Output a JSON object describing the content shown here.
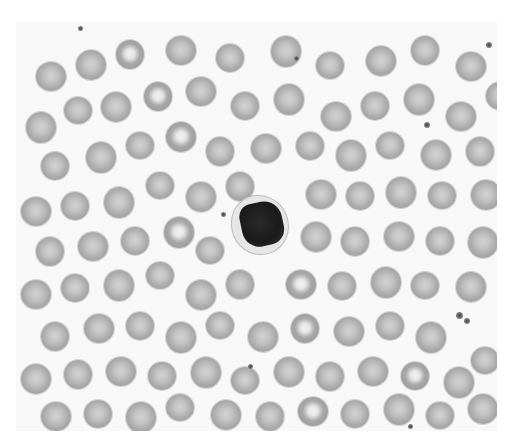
{
  "image": {
    "subject": "peripheral blood smear",
    "background_color": "#f8f8f8",
    "rbc_color": "#a9a9a9",
    "nucleus_color": "#1a1a1a"
  },
  "features": {
    "lymphocyte": {
      "x": 244,
      "y": 225,
      "label": "lymphocyte"
    },
    "platelet_cluster": {
      "x": 450,
      "y": 300
    }
  },
  "cells": [
    [
      20,
      40,
      30
    ],
    [
      60,
      28,
      30
    ],
    [
      100,
      18,
      28
    ],
    [
      150,
      14,
      30
    ],
    [
      200,
      22,
      28
    ],
    [
      255,
      14,
      30
    ],
    [
      300,
      30,
      28
    ],
    [
      350,
      24,
      30
    ],
    [
      395,
      14,
      28
    ],
    [
      440,
      30,
      30
    ],
    [
      470,
      60,
      28
    ],
    [
      10,
      90,
      30
    ],
    [
      48,
      75,
      28
    ],
    [
      85,
      70,
      30
    ],
    [
      128,
      60,
      28
    ],
    [
      170,
      55,
      30
    ],
    [
      215,
      70,
      28
    ],
    [
      258,
      62,
      30
    ],
    [
      305,
      80,
      30
    ],
    [
      345,
      70,
      28
    ],
    [
      388,
      62,
      30
    ],
    [
      430,
      80,
      30
    ],
    [
      25,
      130,
      28
    ],
    [
      70,
      120,
      30
    ],
    [
      110,
      110,
      28
    ],
    [
      150,
      100,
      30
    ],
    [
      190,
      115,
      28
    ],
    [
      235,
      112,
      30
    ],
    [
      280,
      110,
      28
    ],
    [
      320,
      118,
      30
    ],
    [
      360,
      110,
      28
    ],
    [
      405,
      118,
      30
    ],
    [
      450,
      115,
      28
    ],
    [
      5,
      175,
      30
    ],
    [
      45,
      170,
      28
    ],
    [
      88,
      165,
      30
    ],
    [
      130,
      150,
      28
    ],
    [
      170,
      160,
      30
    ],
    [
      210,
      150,
      28
    ],
    [
      290,
      158,
      30
    ],
    [
      330,
      160,
      28
    ],
    [
      370,
      155,
      30
    ],
    [
      412,
      160,
      28
    ],
    [
      455,
      158,
      30
    ],
    [
      20,
      215,
      28
    ],
    [
      62,
      210,
      30
    ],
    [
      105,
      205,
      28
    ],
    [
      148,
      195,
      30
    ],
    [
      180,
      215,
      28
    ],
    [
      285,
      200,
      30
    ],
    [
      325,
      205,
      28
    ],
    [
      368,
      200,
      30
    ],
    [
      410,
      205,
      28
    ],
    [
      452,
      205,
      30
    ],
    [
      5,
      258,
      30
    ],
    [
      45,
      252,
      28
    ],
    [
      88,
      248,
      30
    ],
    [
      130,
      240,
      28
    ],
    [
      170,
      258,
      30
    ],
    [
      210,
      248,
      28
    ],
    [
      270,
      248,
      30
    ],
    [
      312,
      250,
      28
    ],
    [
      355,
      245,
      30
    ],
    [
      395,
      250,
      28
    ],
    [
      440,
      250,
      30
    ],
    [
      25,
      300,
      28
    ],
    [
      68,
      292,
      30
    ],
    [
      110,
      290,
      28
    ],
    [
      150,
      300,
      30
    ],
    [
      190,
      290,
      28
    ],
    [
      232,
      300,
      30
    ],
    [
      275,
      292,
      28
    ],
    [
      318,
      295,
      30
    ],
    [
      360,
      290,
      28
    ],
    [
      400,
      300,
      30
    ],
    [
      455,
      325,
      28
    ],
    [
      5,
      342,
      30
    ],
    [
      48,
      338,
      28
    ],
    [
      90,
      335,
      30
    ],
    [
      132,
      340,
      28
    ],
    [
      175,
      335,
      30
    ],
    [
      215,
      345,
      28
    ],
    [
      258,
      335,
      30
    ],
    [
      300,
      340,
      28
    ],
    [
      342,
      335,
      30
    ],
    [
      385,
      340,
      28
    ],
    [
      428,
      345,
      30
    ],
    [
      25,
      380,
      30
    ],
    [
      68,
      378,
      28
    ],
    [
      110,
      380,
      30
    ],
    [
      150,
      372,
      28
    ],
    [
      195,
      378,
      30
    ],
    [
      240,
      380,
      28
    ],
    [
      282,
      375,
      30
    ],
    [
      325,
      378,
      28
    ],
    [
      368,
      372,
      30
    ],
    [
      410,
      380,
      28
    ],
    [
      452,
      372,
      30
    ]
  ],
  "pale_cells": [
    2,
    14,
    25,
    47,
    60,
    71,
    85,
    93
  ],
  "platelets": [
    [
      62,
      4,
      5
    ],
    [
      278,
      34,
      5
    ],
    [
      470,
      20,
      6
    ],
    [
      408,
      100,
      6
    ],
    [
      205,
      190,
      5
    ],
    [
      232,
      342,
      5
    ],
    [
      392,
      402,
      5
    ],
    [
      440,
      290,
      7
    ],
    [
      448,
      296,
      6
    ]
  ]
}
